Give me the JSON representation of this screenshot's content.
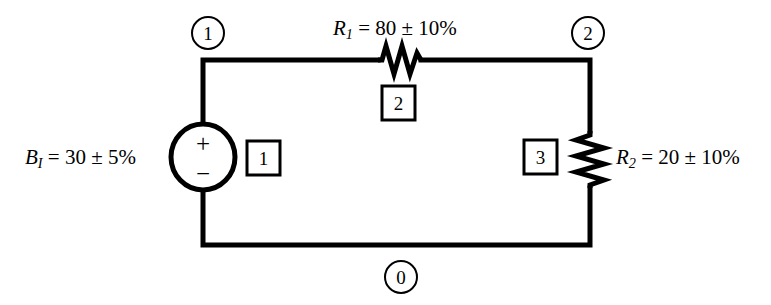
{
  "diagram": {
    "stroke_color": "#000000",
    "background_color": "#ffffff",
    "components": {
      "battery": {
        "name": "voltage-source",
        "symbol_var": "B",
        "symbol_sub": "I",
        "value_text": "= 30 ± 5%",
        "full_label": "B_I = 30 ± 5%",
        "plus_sign": "+",
        "minus_sign": "−",
        "element_number": "1"
      },
      "resistor_1": {
        "name": "resistor-r1",
        "symbol_var": "R",
        "symbol_sub": "1",
        "value_text": "= 80 ± 10%",
        "full_label": "R_1 = 80 ± 10%",
        "element_number": "2"
      },
      "resistor_2": {
        "name": "resistor-r2",
        "symbol_var": "R",
        "symbol_sub": "2",
        "value_text": "= 20 ± 10%",
        "full_label": "R_2 = 20 ± 10%",
        "element_number": "3"
      }
    },
    "nodes": [
      {
        "label": "1",
        "position": "top-left"
      },
      {
        "label": "2",
        "position": "top-right"
      },
      {
        "label": "0",
        "position": "bottom-center"
      }
    ]
  }
}
